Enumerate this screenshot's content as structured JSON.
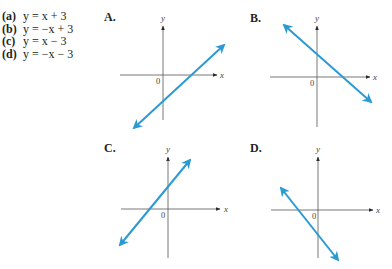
{
  "equations": [
    {
      "label": "(a)",
      "text": "y = x + 3"
    },
    {
      "label": "(b)",
      "text": "y = −x + 3"
    },
    {
      "label": "(c)",
      "text": "y = x − 3"
    },
    {
      "label": "(d)",
      "text": "y = −x − 3"
    }
  ],
  "colors": {
    "line": "#2b9ad3",
    "axis": "#555555",
    "text": "#231f20"
  },
  "graphs": [
    {
      "panel": "A.",
      "x_axis_label": "x",
      "y_axis_label": "y",
      "origin_label": "0",
      "slope": "positive",
      "y_intercept": "negative",
      "x_intercept": "positive"
    },
    {
      "panel": "B.",
      "x_axis_label": "x",
      "y_axis_label": "y",
      "origin_label": "0",
      "slope": "negative",
      "y_intercept": "positive",
      "x_intercept": "positive"
    },
    {
      "panel": "C.",
      "x_axis_label": "x",
      "y_axis_label": "y",
      "origin_label": "0",
      "slope": "positive",
      "y_intercept": "positive",
      "x_intercept": "negative"
    },
    {
      "panel": "D.",
      "x_axis_label": "x",
      "y_axis_label": "y",
      "origin_label": "0",
      "slope": "negative",
      "y_intercept": "negative",
      "x_intercept": "negative"
    }
  ]
}
